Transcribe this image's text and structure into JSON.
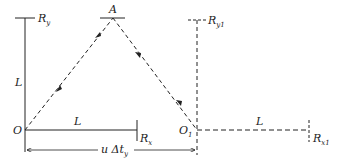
{
  "diagram": {
    "type": "light-clock reference frame diagram",
    "stroke_color": "#222222",
    "points": {
      "O": {
        "label": "O",
        "x": 25,
        "y": 130
      },
      "A": {
        "label": "A",
        "x": 113,
        "y": 18
      },
      "O1": {
        "label": "O",
        "sub": "1",
        "x": 197,
        "y": 130
      }
    },
    "labels": {
      "Ry": {
        "main": "R",
        "sub": "y"
      },
      "Ry1": {
        "main": "R",
        "sub": "y1"
      },
      "Rx": {
        "main": "R",
        "sub": "x"
      },
      "Rx1": {
        "main": "R",
        "sub": "x1"
      },
      "L_vertical": "L",
      "L_horizontal": "L",
      "L_horizontal_moved": "L",
      "dimension": {
        "main": "u Δt",
        "sub": "y"
      }
    }
  }
}
